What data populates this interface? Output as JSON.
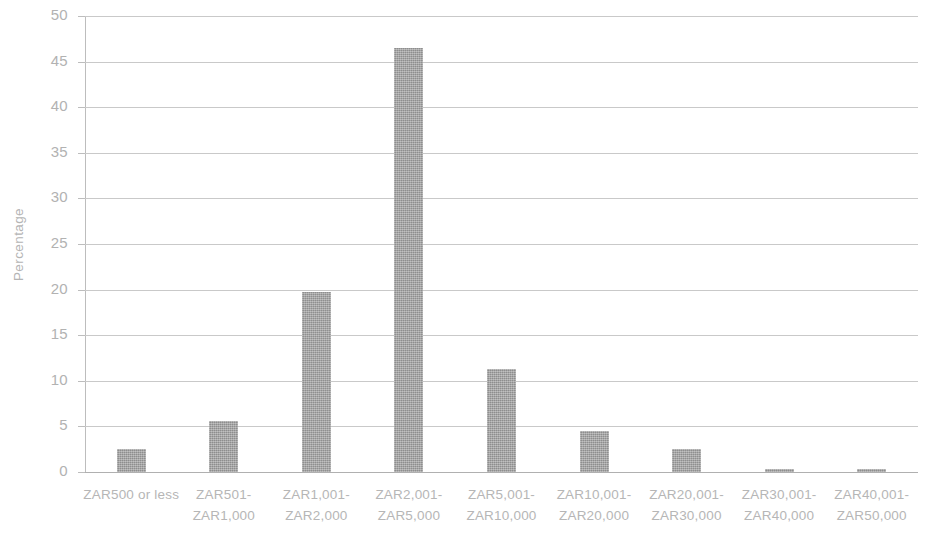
{
  "chart_data": {
    "type": "bar",
    "title": "",
    "xlabel": "",
    "ylabel": "Percentage",
    "ylim": [
      0,
      50
    ],
    "ytick_step": 5,
    "yticks": [
      "50",
      "45",
      "40",
      "35",
      "30",
      "25",
      "20",
      "15",
      "10",
      "5",
      "0"
    ],
    "grid": "horizontal",
    "legend": "none",
    "bar_color": "#9c9c9c",
    "categories": [
      "ZAR500 or less",
      "ZAR501-ZAR1,000",
      "ZAR1,001-ZAR2,000",
      "ZAR2,001-ZAR5,000",
      "ZAR5,001-ZAR10,000",
      "ZAR10,001-ZAR20,000",
      "ZAR20,001-ZAR30,000",
      "ZAR30,001-ZAR40,000",
      "ZAR40,001-ZAR50,000"
    ],
    "category_lines": [
      [
        "ZAR500 or less",
        ""
      ],
      [
        "ZAR501-",
        "ZAR1,000"
      ],
      [
        "ZAR1,001-",
        "ZAR2,000"
      ],
      [
        "ZAR2,001-",
        "ZAR5,000"
      ],
      [
        "ZAR5,001-",
        "ZAR10,000"
      ],
      [
        "ZAR10,001-",
        "ZAR20,000"
      ],
      [
        "ZAR20,001-",
        "ZAR30,000"
      ],
      [
        "ZAR30,001-",
        "ZAR40,000"
      ],
      [
        "ZAR40,001-",
        "ZAR50,000"
      ]
    ],
    "values": [
      2.5,
      5.6,
      19.7,
      46.5,
      11.3,
      4.5,
      2.5,
      0.3,
      0.3
    ]
  }
}
